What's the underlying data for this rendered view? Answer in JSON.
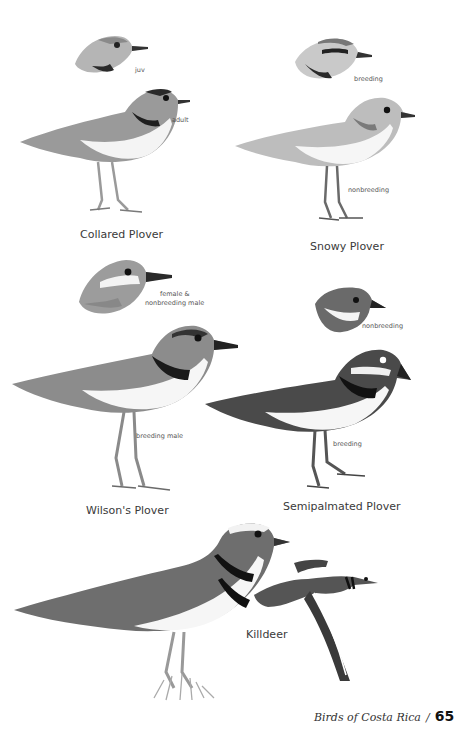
{
  "page": {
    "book_title": "Birds of Costa Rica",
    "separator": "/",
    "page_number": "65"
  },
  "species": [
    {
      "name": "Collared Plover",
      "plates": [
        "juv",
        "adult"
      ]
    },
    {
      "name": "Snowy Plover",
      "plates": [
        "breeding",
        "nonbreeding"
      ]
    },
    {
      "name": "Wilson's Plover",
      "plates": [
        "female &",
        "nonbreeding male",
        "breeding male"
      ]
    },
    {
      "name": "Semipalmated Plover",
      "plates": [
        "nonbreeding",
        "breeding"
      ]
    },
    {
      "name": "Killdeer",
      "plates": []
    }
  ],
  "colors": {
    "paper": "#ffffff",
    "ink": "#333333",
    "bird_dark": "#2a2a2a",
    "bird_mid": "#8a8a8a",
    "bird_light": "#c9c9c9"
  }
}
